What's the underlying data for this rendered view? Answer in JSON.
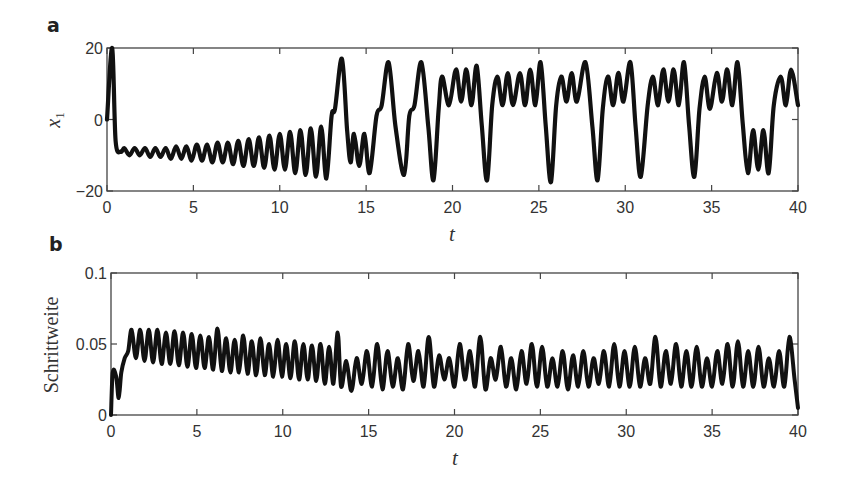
{
  "chart_data": [
    {
      "panel": "a",
      "type": "line",
      "xlabel": "t",
      "ylabel": "x_1",
      "xlim": [
        0,
        40
      ],
      "ylim": [
        -20,
        20
      ],
      "xticks": [
        "0",
        "5",
        "10",
        "15",
        "20",
        "25",
        "30",
        "35",
        "40"
      ],
      "yticks": [
        "-20",
        "0",
        "20"
      ],
      "grid": false,
      "series": [
        {
          "name": "x1",
          "x": [
            0,
            0.3,
            0.5,
            0.8,
            1.0,
            1.3,
            1.6,
            1.9,
            2.2,
            2.5,
            2.8,
            3.1,
            3.4,
            3.7,
            4.0,
            4.3,
            4.6,
            4.9,
            5.2,
            5.5,
            5.8,
            6.1,
            6.4,
            6.7,
            7.0,
            7.3,
            7.6,
            7.9,
            8.2,
            8.5,
            8.8,
            9.1,
            9.4,
            9.7,
            10.0,
            10.3,
            10.6,
            10.9,
            11.2,
            11.5,
            11.8,
            12.1,
            12.4,
            12.7,
            13.0,
            13.2,
            13.6,
            13.9,
            14.1,
            14.3,
            14.6,
            14.9,
            15.2,
            15.6,
            15.9,
            16.3,
            16.7,
            17.2,
            17.5,
            17.8,
            18.2,
            18.6,
            18.9,
            19.2,
            19.4,
            19.8,
            20.2,
            20.5,
            20.8,
            21.1,
            21.4,
            21.7,
            22.0,
            22.3,
            22.6,
            22.9,
            23.2,
            23.5,
            23.9,
            24.2,
            24.5,
            24.8,
            25.1,
            25.4,
            25.7,
            26.0,
            26.3,
            26.6,
            26.9,
            27.2,
            27.7,
            28.1,
            28.4,
            28.7,
            29.0,
            29.3,
            29.6,
            29.9,
            30.3,
            30.6,
            30.9,
            31.3,
            31.6,
            31.9,
            32.2,
            32.5,
            32.8,
            33.1,
            33.4,
            33.7,
            34.0,
            34.3,
            34.6,
            34.9,
            35.3,
            35.6,
            35.9,
            36.2,
            36.5,
            36.8,
            37.1,
            37.4,
            37.7,
            38.0,
            38.3,
            38.6,
            39.0,
            39.3,
            39.6,
            40.0
          ],
          "y": [
            0,
            20,
            -6,
            -9,
            -8,
            -10,
            -8,
            -10,
            -8,
            -10.5,
            -8,
            -10.5,
            -8,
            -11,
            -7.5,
            -11,
            -7.5,
            -11.5,
            -7,
            -11.5,
            -7,
            -12,
            -6.5,
            -12,
            -6.5,
            -12.5,
            -6,
            -13,
            -5.5,
            -13,
            -5,
            -13.5,
            -4.5,
            -14,
            -4,
            -14,
            -3.5,
            -15,
            -3,
            -15.5,
            -2.5,
            -16,
            -2,
            -16.5,
            1,
            3,
            17,
            -3,
            -12,
            -4,
            -13,
            -4,
            -15,
            1,
            4,
            16,
            -2,
            -15.5,
            1,
            4,
            16,
            -2,
            -17,
            3,
            12,
            4,
            14,
            5,
            14,
            4,
            15,
            -2,
            -17,
            4,
            12,
            4,
            13,
            4,
            13,
            4,
            14,
            4,
            16,
            -2,
            -17.5,
            4,
            12,
            5,
            13,
            5,
            16,
            -2,
            -17,
            3,
            12,
            4,
            13,
            5,
            16,
            -2,
            -16,
            4,
            12,
            4,
            14,
            5,
            14,
            4,
            16,
            -2,
            -16,
            3,
            12,
            3,
            13,
            5,
            14,
            4,
            16,
            -1,
            -15,
            -3,
            -14,
            -3,
            -15,
            4,
            12,
            4,
            14,
            4,
            13,
            4,
            14,
            4,
            16,
            2,
            -10,
            -2,
            -13,
            -2,
            0
          ],
          "color": "#111111"
        }
      ]
    },
    {
      "panel": "b",
      "type": "line",
      "xlabel": "t",
      "ylabel": "Schrittweite",
      "xlim": [
        0,
        40
      ],
      "ylim": [
        0,
        0.1
      ],
      "xticks": [
        "0",
        "5",
        "10",
        "15",
        "20",
        "25",
        "30",
        "35",
        "40"
      ],
      "yticks": [
        "0",
        "0.05",
        "0.1"
      ],
      "grid": false,
      "series": [
        {
          "name": "Schrittweite",
          "x": [
            0,
            0.1,
            0.3,
            0.45,
            0.6,
            0.8,
            1.0,
            1.2,
            1.45,
            1.7,
            1.95,
            2.2,
            2.45,
            2.7,
            2.95,
            3.2,
            3.45,
            3.7,
            3.95,
            4.2,
            4.45,
            4.7,
            4.95,
            5.2,
            5.45,
            5.7,
            5.95,
            6.2,
            6.45,
            6.7,
            6.95,
            7.2,
            7.45,
            7.7,
            7.95,
            8.2,
            8.45,
            8.7,
            8.95,
            9.2,
            9.45,
            9.7,
            9.95,
            10.2,
            10.45,
            10.7,
            10.95,
            11.2,
            11.45,
            11.7,
            11.95,
            12.2,
            12.45,
            12.7,
            12.95,
            13.2,
            13.4,
            13.7,
            14.0,
            14.3,
            14.6,
            14.9,
            15.2,
            15.5,
            15.8,
            16.1,
            16.4,
            16.7,
            17.0,
            17.3,
            17.6,
            17.9,
            18.2,
            18.5,
            18.8,
            19.1,
            19.4,
            19.7,
            20.0,
            20.3,
            20.6,
            20.9,
            21.2,
            21.5,
            21.8,
            22.1,
            22.4,
            22.7,
            23.0,
            23.3,
            23.6,
            23.9,
            24.2,
            24.5,
            24.8,
            25.1,
            25.4,
            25.7,
            26.0,
            26.3,
            26.6,
            26.9,
            27.2,
            27.5,
            27.8,
            28.1,
            28.4,
            28.7,
            29.0,
            29.3,
            29.6,
            29.9,
            30.2,
            30.5,
            30.8,
            31.1,
            31.4,
            31.7,
            32.0,
            32.3,
            32.6,
            32.9,
            33.2,
            33.5,
            33.8,
            34.1,
            34.4,
            34.7,
            35.0,
            35.3,
            35.6,
            35.9,
            36.2,
            36.5,
            36.8,
            37.1,
            37.4,
            37.7,
            38.0,
            38.3,
            38.6,
            38.9,
            39.2,
            39.5,
            39.8,
            40.0
          ],
          "y": [
            0.0,
            0.03,
            0.027,
            0.012,
            0.03,
            0.04,
            0.045,
            0.06,
            0.04,
            0.06,
            0.038,
            0.06,
            0.037,
            0.06,
            0.036,
            0.058,
            0.036,
            0.059,
            0.035,
            0.058,
            0.034,
            0.057,
            0.033,
            0.056,
            0.033,
            0.055,
            0.032,
            0.061,
            0.031,
            0.054,
            0.03,
            0.053,
            0.03,
            0.056,
            0.029,
            0.052,
            0.028,
            0.054,
            0.028,
            0.05,
            0.027,
            0.053,
            0.027,
            0.05,
            0.026,
            0.052,
            0.025,
            0.05,
            0.025,
            0.049,
            0.024,
            0.05,
            0.022,
            0.048,
            0.022,
            0.058,
            0.02,
            0.038,
            0.017,
            0.04,
            0.022,
            0.045,
            0.02,
            0.05,
            0.018,
            0.045,
            0.02,
            0.04,
            0.018,
            0.05,
            0.024,
            0.045,
            0.02,
            0.055,
            0.02,
            0.042,
            0.025,
            0.04,
            0.02,
            0.05,
            0.025,
            0.045,
            0.02,
            0.055,
            0.018,
            0.04,
            0.025,
            0.048,
            0.02,
            0.04,
            0.018,
            0.045,
            0.022,
            0.05,
            0.02,
            0.048,
            0.02,
            0.04,
            0.02,
            0.045,
            0.018,
            0.042,
            0.02,
            0.045,
            0.02,
            0.04,
            0.022,
            0.045,
            0.02,
            0.05,
            0.02,
            0.045,
            0.02,
            0.048,
            0.02,
            0.04,
            0.022,
            0.055,
            0.02,
            0.045,
            0.022,
            0.05,
            0.02,
            0.045,
            0.02,
            0.048,
            0.02,
            0.04,
            0.02,
            0.045,
            0.022,
            0.05,
            0.02,
            0.052,
            0.02,
            0.045,
            0.02,
            0.048,
            0.02,
            0.04,
            0.02,
            0.045,
            0.02,
            0.055,
            0.025,
            0.005
          ],
          "color": "#111111"
        }
      ]
    }
  ],
  "panels": {
    "a": {
      "letter": "a",
      "ylabel_main": "x",
      "ylabel_sub": "1",
      "xlabel": "t"
    },
    "b": {
      "letter": "b",
      "ylabel": "Schrittweite",
      "xlabel": "t"
    }
  }
}
